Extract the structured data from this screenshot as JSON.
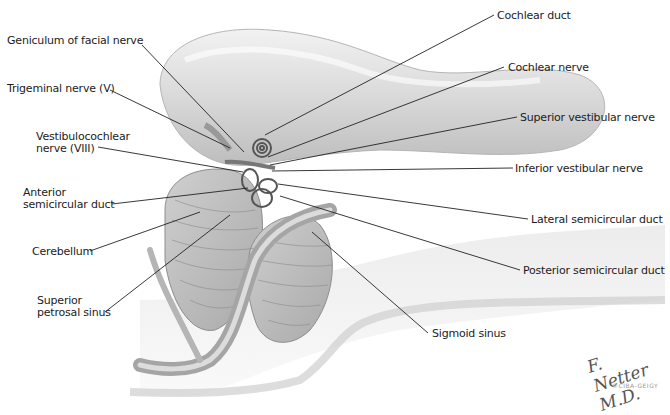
{
  "figure": {
    "type": "anatomical-illustration",
    "labels_left": [
      "Geniculum of facial nerve",
      "Trigeminal nerve (V)",
      "Vestibulocochlear nerve (VIII)",
      "Anterior semicircular duct",
      "Cerebellum",
      "Superior petrosal sinus"
    ],
    "labels_right": [
      "Cochlear duct",
      "Cochlear nerve",
      "Superior vestibular nerve",
      "Inferior vestibular nerve",
      "Lateral semicircular duct",
      "Posterior semicircular duct"
    ],
    "labels_bottom": [
      "Sigmoid sinus"
    ],
    "signature": "F. Netter M.D.",
    "signature_sub": "©CIBA-GEIGY"
  },
  "text": {
    "geniculum": "Geniculum of facial nerve",
    "trigeminal": "Trigeminal nerve (V)",
    "vestibulo_1": "Vestibulocochlear",
    "vestibulo_2": "nerve (VIII)",
    "anterior_1": "Anterior",
    "anterior_2": "semicircular duct",
    "cerebellum": "Cerebellum",
    "petrosal_1": "Superior",
    "petrosal_2": "petrosal sinus",
    "cochlear_duct": "Cochlear duct",
    "cochlear_nerve": "Cochlear nerve",
    "sup_vest": "Superior vestibular nerve",
    "inf_vest": "Inferior vestibular nerve",
    "lateral": "Lateral semicircular duct",
    "posterior": "Posterior semicircular duct",
    "sigmoid": "Sigmoid sinus",
    "signature": "F. Netter M.D.",
    "signature_sub": "©CIBA-GEIGY"
  },
  "colors": {
    "ink": "#1c1c1c",
    "tissue_light": "#e4e4e4",
    "tissue_mid": "#c8c8c8",
    "tissue_dark": "#9a9a9a"
  }
}
